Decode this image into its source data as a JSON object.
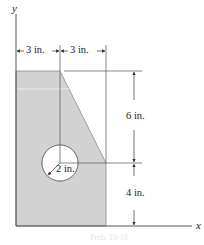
{
  "figure": {
    "axes": {
      "x_label": "x",
      "y_label": "y"
    },
    "dimensions": {
      "top_left_width": "3 in.",
      "top_right_width": "3 in.",
      "upper_height": "6 in.",
      "lower_height": "4 in.",
      "hole_radius": "2 in."
    },
    "caption": "Prob. 10-10",
    "colors": {
      "shape_fill": "#d2d2d2",
      "shape_stroke": "#8a8a8a",
      "line": "#444444",
      "background": "#ffffff"
    }
  }
}
